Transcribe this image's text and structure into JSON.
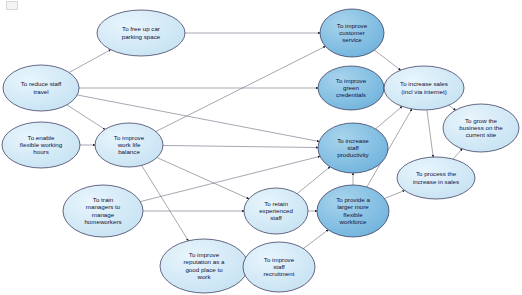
{
  "diagram": {
    "canvas": {
      "width": 522,
      "height": 295,
      "background": "#ffffff"
    },
    "colors": {
      "node_light_fill": "#cfe7f5",
      "node_dark_fill": "#86bfe3",
      "node_stroke": "#2b2b4f",
      "edge_stroke": "#6b6b80",
      "label_text": "#101038"
    },
    "nodes": [
      {
        "id": "parking",
        "label": "To free up car parking space",
        "lines": [
          "To free up car",
          "parking space"
        ],
        "cx": 141,
        "cy": 33,
        "rx": 44,
        "ry": 23,
        "shade": "light"
      },
      {
        "id": "customer",
        "label": "To improve customer service",
        "lines": [
          "To improve",
          "customer",
          "service"
        ],
        "cx": 352,
        "cy": 33,
        "rx": 32,
        "ry": 24,
        "shade": "dark"
      },
      {
        "id": "reduce_travel",
        "label": "To reduce staff travel",
        "lines": [
          "To reduce staff",
          "travel"
        ],
        "cx": 41,
        "cy": 88,
        "rx": 38,
        "ry": 23,
        "shade": "light"
      },
      {
        "id": "green",
        "label": "To improve green credentials",
        "lines": [
          "To improve",
          "green",
          "credentials"
        ],
        "cx": 351,
        "cy": 88,
        "rx": 33,
        "ry": 22,
        "shade": "dark"
      },
      {
        "id": "sales",
        "label": "To increase sales (incl via internet)",
        "lines": [
          "To increase sales",
          "(incl via internet)"
        ],
        "cx": 424,
        "cy": 88,
        "rx": 40,
        "ry": 22,
        "shade": "light"
      },
      {
        "id": "grow",
        "label": "To grow the business on the current site",
        "lines": [
          "To grow the",
          "business on the",
          "current site"
        ],
        "cx": 481,
        "cy": 128,
        "rx": 38,
        "ry": 24,
        "shade": "light"
      },
      {
        "id": "flexible_hours",
        "label": "To enable flexible working hours",
        "lines": [
          "To enable",
          "flexible working",
          "hours"
        ],
        "cx": 41,
        "cy": 145,
        "rx": 39,
        "ry": 23,
        "shade": "light"
      },
      {
        "id": "worklife",
        "label": "To improve work life balance",
        "lines": [
          "To improve",
          "work life",
          "balance"
        ],
        "cx": 129,
        "cy": 145,
        "rx": 34,
        "ry": 22,
        "shade": "light"
      },
      {
        "id": "productivity",
        "label": "To increase staff productivity",
        "lines": [
          "To increase",
          "staff",
          "productivity"
        ],
        "cx": 353,
        "cy": 148,
        "rx": 35,
        "ry": 25,
        "shade": "dark"
      },
      {
        "id": "process_sales",
        "label": "To process the increase in sales",
        "lines": [
          "To process the",
          "increase in sales"
        ],
        "cx": 436,
        "cy": 178,
        "rx": 39,
        "ry": 21,
        "shade": "light"
      },
      {
        "id": "train_managers",
        "label": "To train managers to manage homeworkers",
        "lines": [
          "To train",
          "managers to",
          "manage",
          "homeworkers"
        ],
        "cx": 103,
        "cy": 211,
        "rx": 40,
        "ry": 26,
        "shade": "light"
      },
      {
        "id": "retain",
        "label": "To retain experienced staff",
        "lines": [
          "To retain",
          "experienced",
          "staff"
        ],
        "cx": 276,
        "cy": 211,
        "rx": 32,
        "ry": 23,
        "shade": "light"
      },
      {
        "id": "workforce",
        "label": "To provide a larger more flexible workforce",
        "lines": [
          "To provide a",
          "larger more",
          "flexible",
          "workforce"
        ],
        "cx": 353,
        "cy": 211,
        "rx": 36,
        "ry": 26,
        "shade": "dark"
      },
      {
        "id": "reputation",
        "label": "To improve reputation as a good place to work",
        "lines": [
          "To improve",
          "reputation as a",
          "good place to",
          "work"
        ],
        "cx": 204,
        "cy": 266,
        "rx": 44,
        "ry": 27,
        "shade": "light"
      },
      {
        "id": "recruitment",
        "label": "To improve staff recruitment",
        "lines": [
          "To improve",
          "staff",
          "recruitment"
        ],
        "cx": 279,
        "cy": 267,
        "rx": 36,
        "ry": 25,
        "shade": "light"
      }
    ],
    "edges": [
      {
        "from": "reduce_travel",
        "to": "parking"
      },
      {
        "from": "reduce_travel",
        "to": "worklife"
      },
      {
        "from": "reduce_travel",
        "to": "green"
      },
      {
        "from": "reduce_travel",
        "to": "productivity"
      },
      {
        "from": "parking",
        "to": "customer"
      },
      {
        "from": "flexible_hours",
        "to": "worklife"
      },
      {
        "from": "worklife",
        "to": "customer"
      },
      {
        "from": "worklife",
        "to": "productivity"
      },
      {
        "from": "worklife",
        "to": "retain"
      },
      {
        "from": "worklife",
        "to": "reputation"
      },
      {
        "from": "train_managers",
        "to": "retain"
      },
      {
        "from": "train_managers",
        "to": "productivity"
      },
      {
        "from": "reputation",
        "to": "recruitment"
      },
      {
        "from": "recruitment",
        "to": "workforce"
      },
      {
        "from": "retain",
        "to": "workforce"
      },
      {
        "from": "retain",
        "to": "productivity"
      },
      {
        "from": "productivity",
        "to": "sales"
      },
      {
        "from": "workforce",
        "to": "productivity"
      },
      {
        "from": "workforce",
        "to": "sales"
      },
      {
        "from": "workforce",
        "to": "process_sales"
      },
      {
        "from": "green",
        "to": "sales"
      },
      {
        "from": "customer",
        "to": "sales"
      },
      {
        "from": "sales",
        "to": "grow"
      },
      {
        "from": "sales",
        "to": "process_sales"
      },
      {
        "from": "process_sales",
        "to": "grow"
      }
    ]
  }
}
